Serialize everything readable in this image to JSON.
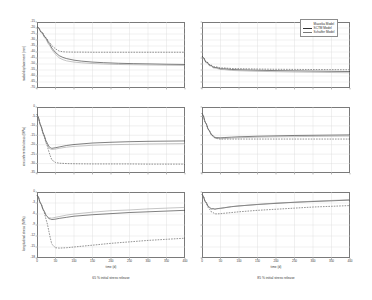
{
  "figure": {
    "legend": {
      "items": [
        {
          "label": "Mazzika Model",
          "style": "dashed"
        },
        {
          "label": "SCTM Model",
          "style": "solid"
        },
        {
          "label": "Schaffer Model",
          "style": "thin"
        }
      ]
    },
    "columns": [
      {
        "caption": "65 % initial stress release"
      },
      {
        "caption": "85 % initial stress release"
      }
    ],
    "xlabel": "time (d)"
  },
  "chart_data": [
    {
      "type": "line",
      "title": "",
      "panel": "top-left",
      "xlabel": "time (d)",
      "ylabel": "radial displacement (mm)",
      "xlim": [
        0,
        400
      ],
      "ylim": [
        -70,
        -15
      ],
      "xticks": [
        0,
        50,
        100,
        150,
        200,
        250,
        300,
        350,
        400
      ],
      "yticks": [
        -15,
        -20,
        -25,
        -30,
        -35,
        -40,
        -45,
        -50,
        -55,
        -60,
        -65,
        -70
      ],
      "ytick_labels": [
        "-15",
        "-20",
        "-25",
        "-30",
        "-35",
        "-40",
        "-45",
        "-50",
        "-55",
        "-60",
        "-65",
        "-70"
      ],
      "grid": true,
      "legend_position": "top-right-of-figure",
      "x": [
        0,
        5,
        10,
        15,
        20,
        25,
        30,
        35,
        40,
        50,
        60,
        70,
        80,
        100,
        120,
        150,
        180,
        220,
        260,
        300,
        350,
        400
      ],
      "series": [
        {
          "name": "Mazzika Model",
          "style": "dashed",
          "values": [
            -18.5,
            -20.5,
            -22.5,
            -24.5,
            -26.5,
            -28.5,
            -30.5,
            -32.5,
            -34.5,
            -37.5,
            -39.2,
            -39.8,
            -40.0,
            -40.1,
            -40.1,
            -40.2,
            -40.2,
            -40.2,
            -40.2,
            -40.2,
            -40.2,
            -40.2
          ]
        },
        {
          "name": "SCTM Model",
          "style": "solid",
          "values": [
            -18.5,
            -20.5,
            -22.5,
            -24.5,
            -26.8,
            -29.0,
            -31.5,
            -34.0,
            -36.5,
            -40.5,
            -43.0,
            -44.5,
            -45.5,
            -46.8,
            -47.6,
            -48.4,
            -48.9,
            -49.4,
            -49.7,
            -49.9,
            -50.2,
            -50.4
          ]
        },
        {
          "name": "Schaffer Model",
          "style": "thin",
          "values": [
            -18.5,
            -20.8,
            -23.0,
            -25.2,
            -27.5,
            -30.0,
            -32.6,
            -35.2,
            -37.8,
            -42.0,
            -44.8,
            -46.4,
            -47.4,
            -48.4,
            -49.0,
            -49.6,
            -50.0,
            -50.4,
            -50.6,
            -50.8,
            -51.0,
            -51.2
          ]
        }
      ]
    },
    {
      "type": "line",
      "panel": "top-right",
      "xlabel": "time (d)",
      "ylabel": "radial displacement (mm)",
      "xlim": [
        0,
        400
      ],
      "ylim": [
        -70,
        -15
      ],
      "xticks": [
        0,
        50,
        100,
        150,
        200,
        250,
        300,
        350,
        400
      ],
      "yticks": [
        -15,
        -20,
        -25,
        -30,
        -35,
        -40,
        -45,
        -50,
        -55,
        -60,
        -65,
        -70
      ],
      "grid": true,
      "x": [
        0,
        5,
        10,
        15,
        20,
        25,
        30,
        40,
        50,
        60,
        80,
        100,
        150,
        200,
        250,
        300,
        350,
        400
      ],
      "series": [
        {
          "name": "Mazzika Model",
          "style": "dashed",
          "values": [
            -43.0,
            -45.5,
            -47.5,
            -49.0,
            -50.2,
            -51.2,
            -51.9,
            -52.7,
            -53.1,
            -53.4,
            -53.7,
            -53.9,
            -54.2,
            -54.4,
            -54.5,
            -54.6,
            -54.7,
            -54.8
          ]
        },
        {
          "name": "SCTM Model",
          "style": "solid",
          "values": [
            -43.0,
            -45.6,
            -47.7,
            -49.3,
            -50.6,
            -51.6,
            -52.4,
            -53.3,
            -53.8,
            -54.1,
            -54.5,
            -54.8,
            -55.2,
            -55.5,
            -55.7,
            -55.9,
            -56.1,
            -56.3
          ]
        },
        {
          "name": "Schaffer Model",
          "style": "thin",
          "values": [
            -43.2,
            -46.0,
            -48.2,
            -49.8,
            -51.1,
            -52.1,
            -52.9,
            -53.9,
            -54.4,
            -54.8,
            -55.3,
            -55.6,
            -56.1,
            -56.4,
            -56.7,
            -56.9,
            -57.1,
            -57.3
          ]
        }
      ]
    },
    {
      "type": "line",
      "panel": "middle-left",
      "xlabel": "time (d)",
      "ylabel": "circumferential stress (MPa)",
      "xlim": [
        0,
        400
      ],
      "ylim": [
        -35,
        0
      ],
      "xticks": [
        0,
        50,
        100,
        150,
        200,
        250,
        300,
        350,
        400
      ],
      "yticks": [
        0,
        -5,
        -10,
        -15,
        -20,
        -25,
        -30,
        -35
      ],
      "ytick_labels": [
        "0",
        "-5",
        "-10",
        "-15",
        "-20",
        "-25",
        "-30",
        "-35"
      ],
      "grid": true,
      "x": [
        0,
        4,
        8,
        12,
        16,
        20,
        24,
        28,
        32,
        36,
        40,
        50,
        60,
        80,
        100,
        150,
        200,
        250,
        300,
        350,
        400
      ],
      "series": [
        {
          "name": "Mazzika Model",
          "style": "dashed",
          "values": [
            -3.5,
            -6.0,
            -8.5,
            -11.0,
            -13.5,
            -16.0,
            -18.5,
            -21.0,
            -23.5,
            -26.0,
            -28.0,
            -29.4,
            -29.8,
            -30.0,
            -30.1,
            -30.2,
            -30.2,
            -30.2,
            -30.3,
            -30.3,
            -30.3
          ]
        },
        {
          "name": "SCTM Model",
          "style": "solid",
          "values": [
            -3.5,
            -6.0,
            -8.5,
            -11.0,
            -13.2,
            -15.5,
            -17.6,
            -19.4,
            -20.8,
            -21.6,
            -21.9,
            -21.6,
            -21.2,
            -20.4,
            -19.9,
            -19.1,
            -18.7,
            -18.4,
            -18.2,
            -18.1,
            -18.0
          ]
        },
        {
          "name": "Schaffer Model",
          "style": "thin",
          "values": [
            -3.5,
            -6.2,
            -8.8,
            -11.4,
            -13.8,
            -16.2,
            -18.4,
            -20.3,
            -21.6,
            -22.3,
            -22.5,
            -22.3,
            -21.9,
            -21.3,
            -20.9,
            -20.3,
            -20.0,
            -19.8,
            -19.6,
            -19.5,
            -19.4
          ]
        }
      ]
    },
    {
      "type": "line",
      "panel": "middle-right",
      "xlabel": "time (d)",
      "ylabel": "circumferential stress (MPa)",
      "xlim": [
        0,
        400
      ],
      "ylim": [
        -35,
        0
      ],
      "xticks": [
        0,
        50,
        100,
        150,
        200,
        250,
        300,
        350,
        400
      ],
      "yticks": [
        0,
        -5,
        -10,
        -15,
        -20,
        -25,
        -30,
        -35
      ],
      "grid": true,
      "x": [
        0,
        4,
        8,
        12,
        16,
        20,
        25,
        30,
        35,
        40,
        50,
        60,
        80,
        100,
        150,
        200,
        250,
        300,
        350,
        400
      ],
      "series": [
        {
          "name": "Mazzika Model",
          "style": "dashed",
          "values": [
            -3.0,
            -5.2,
            -7.4,
            -9.4,
            -11.2,
            -12.8,
            -14.4,
            -15.6,
            -16.4,
            -16.8,
            -17.0,
            -17.0,
            -17.0,
            -17.0,
            -17.0,
            -17.0,
            -17.0,
            -17.0,
            -17.0,
            -17.0
          ]
        },
        {
          "name": "SCTM Model",
          "style": "solid",
          "values": [
            -3.0,
            -5.2,
            -7.4,
            -9.4,
            -11.2,
            -12.8,
            -14.3,
            -15.4,
            -16.0,
            -16.3,
            -16.3,
            -16.2,
            -16.0,
            -15.8,
            -15.5,
            -15.3,
            -15.1,
            -15.0,
            -14.9,
            -14.8
          ]
        },
        {
          "name": "Schaffer Model",
          "style": "thin",
          "values": [
            -3.0,
            -5.3,
            -7.6,
            -9.6,
            -11.5,
            -13.1,
            -14.7,
            -15.8,
            -16.4,
            -16.7,
            -16.8,
            -16.7,
            -16.5,
            -16.3,
            -16.0,
            -15.8,
            -15.7,
            -15.6,
            -15.5,
            -15.4
          ]
        }
      ]
    },
    {
      "type": "line",
      "panel": "bottom-left",
      "xlabel": "time (d)",
      "ylabel": "longitudinal stress (MPa)",
      "xlim": [
        0,
        400
      ],
      "ylim": [
        -18,
        0
      ],
      "xticks": [
        0,
        50,
        100,
        150,
        200,
        250,
        300,
        350,
        400
      ],
      "yticks": [
        0,
        -3,
        -6,
        -9,
        -12,
        -15,
        -18
      ],
      "ytick_labels": [
        "0",
        "-3",
        "-6",
        "-9",
        "-12",
        "-15",
        "-18"
      ],
      "grid": true,
      "x": [
        0,
        4,
        8,
        12,
        16,
        20,
        24,
        28,
        32,
        36,
        40,
        50,
        60,
        80,
        100,
        150,
        200,
        250,
        300,
        350,
        400
      ],
      "series": [
        {
          "name": "Mazzika Model",
          "style": "dashed",
          "values": [
            -0.6,
            -1.6,
            -2.6,
            -3.6,
            -4.6,
            -5.8,
            -7.2,
            -8.8,
            -10.6,
            -12.6,
            -14.2,
            -15.2,
            -15.3,
            -15.2,
            -15.0,
            -14.5,
            -14.0,
            -13.6,
            -13.2,
            -12.9,
            -12.6
          ]
        },
        {
          "name": "SCTM Model",
          "style": "solid",
          "values": [
            -0.6,
            -1.6,
            -2.6,
            -3.6,
            -4.5,
            -5.4,
            -6.2,
            -6.8,
            -7.2,
            -7.4,
            -7.5,
            -7.4,
            -7.2,
            -6.9,
            -6.6,
            -6.2,
            -5.9,
            -5.6,
            -5.4,
            -5.2,
            -5.0
          ]
        },
        {
          "name": "Schaffer Model",
          "style": "thin",
          "values": [
            -0.6,
            -1.7,
            -2.7,
            -3.7,
            -4.6,
            -5.5,
            -6.2,
            -6.7,
            -7.0,
            -7.1,
            -7.1,
            -6.9,
            -6.7,
            -6.3,
            -6.0,
            -5.5,
            -5.1,
            -4.9,
            -4.6,
            -4.4,
            -4.2
          ]
        }
      ]
    },
    {
      "type": "line",
      "panel": "bottom-right",
      "xlabel": "time (d)",
      "ylabel": "longitudinal stress (MPa)",
      "xlim": [
        0,
        18
      ],
      "ylim": [
        -18,
        0
      ],
      "xticks": [
        0,
        50,
        100,
        150,
        200,
        250,
        300,
        350,
        400
      ],
      "yticks": [
        0,
        -3,
        -6,
        -9,
        -12,
        -15,
        -18
      ],
      "grid": true,
      "x": [
        0,
        4,
        8,
        12,
        16,
        20,
        25,
        30,
        35,
        40,
        50,
        60,
        80,
        100,
        150,
        200,
        250,
        300,
        350,
        400
      ],
      "series": [
        {
          "name": "Mazzika Model",
          "style": "dashed",
          "values": [
            -0.5,
            -1.4,
            -2.3,
            -3.2,
            -4.0,
            -4.7,
            -5.3,
            -5.7,
            -5.9,
            -6.0,
            -5.9,
            -5.8,
            -5.6,
            -5.4,
            -5.0,
            -4.7,
            -4.4,
            -4.1,
            -3.9,
            -3.7
          ]
        },
        {
          "name": "SCTM Model",
          "style": "solid",
          "values": [
            -0.5,
            -1.4,
            -2.3,
            -3.1,
            -3.7,
            -4.2,
            -4.5,
            -4.6,
            -4.6,
            -4.6,
            -4.4,
            -4.3,
            -4.0,
            -3.8,
            -3.4,
            -3.1,
            -2.8,
            -2.6,
            -2.4,
            -2.2
          ]
        },
        {
          "name": "Schaffer Model",
          "style": "thin",
          "values": [
            -0.5,
            -1.5,
            -2.4,
            -3.2,
            -3.8,
            -4.3,
            -4.6,
            -4.7,
            -4.7,
            -4.6,
            -4.5,
            -4.3,
            -4.0,
            -3.8,
            -3.4,
            -3.0,
            -2.8,
            -2.5,
            -2.3,
            -2.1
          ]
        }
      ]
    }
  ]
}
